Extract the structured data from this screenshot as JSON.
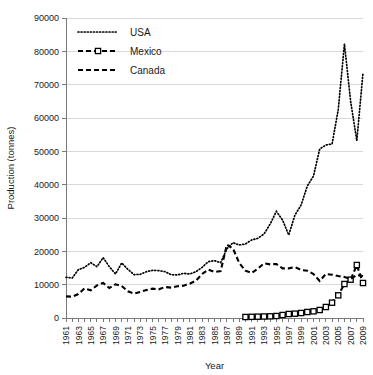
{
  "chart_data": {
    "type": "line",
    "title": "",
    "xlabel": "Year",
    "ylabel": "Production (tonnes)",
    "xlim": [
      1961,
      2009
    ],
    "ylim": [
      0,
      90000
    ],
    "grid": true,
    "legend_position": "top-left",
    "y_ticks": [
      "0",
      "10000",
      "20000",
      "30000",
      "40000",
      "50000",
      "60000",
      "70000",
      "80000",
      "90000"
    ],
    "y_tick_values": [
      0,
      10000,
      20000,
      30000,
      40000,
      50000,
      60000,
      70000,
      80000,
      90000
    ],
    "x_ticks": [
      "1961",
      "1963",
      "1965",
      "1967",
      "1969",
      "1971",
      "1973",
      "1975",
      "1977",
      "1979",
      "1981",
      "1983",
      "1985",
      "1987",
      "1989",
      "1991",
      "1993",
      "1995",
      "1997",
      "1999",
      "2001",
      "2003",
      "2005",
      "2007",
      "2009"
    ],
    "x_tick_values": [
      1961,
      1963,
      1965,
      1967,
      1969,
      1971,
      1973,
      1975,
      1977,
      1979,
      1981,
      1983,
      1985,
      1987,
      1989,
      1991,
      1993,
      1995,
      1997,
      1999,
      2001,
      2003,
      2005,
      2007,
      2009
    ],
    "x_all_years": [
      1961,
      1962,
      1963,
      1964,
      1965,
      1966,
      1967,
      1968,
      1969,
      1970,
      1971,
      1972,
      1973,
      1974,
      1975,
      1976,
      1977,
      1978,
      1979,
      1980,
      1981,
      1982,
      1983,
      1984,
      1985,
      1986,
      1987,
      1988,
      1989,
      1990,
      1991,
      1992,
      1993,
      1994,
      1995,
      1996,
      1997,
      1998,
      1999,
      2000,
      2001,
      2002,
      2003,
      2004,
      2005,
      2006,
      2007,
      2008,
      2009
    ],
    "series": [
      {
        "name": "USA",
        "style": "dotted",
        "color": "#000000",
        "marker": "none",
        "x": [
          1961,
          1962,
          1963,
          1964,
          1965,
          1966,
          1967,
          1968,
          1969,
          1970,
          1971,
          1972,
          1973,
          1974,
          1975,
          1976,
          1977,
          1978,
          1979,
          1980,
          1981,
          1982,
          1983,
          1984,
          1985,
          1986,
          1987,
          1988,
          1989,
          1990,
          1991,
          1992,
          1993,
          1994,
          1995,
          1996,
          1997,
          1998,
          1999,
          2000,
          2001,
          2002,
          2003,
          2004,
          2005,
          2006,
          2007,
          2008,
          2009
        ],
        "values": [
          12200,
          12000,
          14500,
          15200,
          16600,
          15400,
          18100,
          15400,
          13200,
          16500,
          14600,
          13000,
          13100,
          13900,
          14300,
          14200,
          13900,
          13000,
          12900,
          13400,
          13200,
          13900,
          15200,
          16900,
          17200,
          16600,
          20800,
          22600,
          21900,
          22200,
          23400,
          23900,
          25200,
          28200,
          32000,
          29400,
          24900,
          30900,
          33900,
          39600,
          42600,
          50700,
          51900,
          52200,
          62500,
          82200,
          65000,
          53200,
          73500
        ]
      },
      {
        "name": "Mexico",
        "style": "dashed-marker",
        "color": "#000000",
        "marker": "square",
        "x": [
          1990,
          1991,
          1992,
          1993,
          1994,
          1995,
          1996,
          1997,
          1998,
          1999,
          2000,
          2001,
          2002,
          2003,
          2004,
          2005,
          2006,
          2007,
          2008,
          2009
        ],
        "values": [
          300,
          350,
          400,
          450,
          500,
          600,
          900,
          1200,
          1300,
          1500,
          1800,
          2000,
          2400,
          3300,
          4600,
          6800,
          10200,
          11500,
          15900,
          10500
        ]
      },
      {
        "name": "Canada",
        "style": "dashed",
        "color": "#000000",
        "marker": "none",
        "x": [
          1961,
          1962,
          1963,
          1964,
          1965,
          1966,
          1967,
          1968,
          1969,
          1970,
          1971,
          1972,
          1973,
          1974,
          1975,
          1976,
          1977,
          1978,
          1979,
          1980,
          1981,
          1982,
          1983,
          1984,
          1985,
          1986,
          1987,
          1988,
          1989,
          1990,
          1991,
          1992,
          1993,
          1994,
          1995,
          1996,
          1997,
          1998,
          1999,
          2000,
          2001,
          2002,
          2003,
          2004,
          2005,
          2006,
          2007,
          2008,
          2009
        ],
        "values": [
          6500,
          6400,
          7200,
          8900,
          8300,
          9800,
          10500,
          9000,
          10100,
          9600,
          8000,
          7300,
          7800,
          8400,
          8800,
          8600,
          9300,
          9100,
          9500,
          9700,
          10300,
          11200,
          13200,
          14500,
          13800,
          14100,
          22000,
          20800,
          16500,
          14200,
          13500,
          14800,
          16400,
          16100,
          16200,
          14900,
          14900,
          15300,
          14400,
          14200,
          13200,
          11100,
          13200,
          13000,
          12600,
          12300,
          11700,
          12900,
          12600
        ]
      }
    ]
  },
  "legend": {
    "items": [
      {
        "label": "USA",
        "style": "dotted"
      },
      {
        "label": "Mexico",
        "style": "dashed-marker"
      },
      {
        "label": "Canada",
        "style": "dashed"
      }
    ]
  }
}
